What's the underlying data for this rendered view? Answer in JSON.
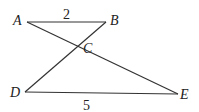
{
  "diagram": {
    "points": {
      "A": {
        "label": "A",
        "x": 27,
        "y": 22
      },
      "B": {
        "label": "B",
        "x": 106,
        "y": 22
      },
      "C": {
        "label": "C",
        "x": 78,
        "y": 47
      },
      "D": {
        "label": "D",
        "x": 25,
        "y": 92
      },
      "E": {
        "label": "E",
        "x": 178,
        "y": 94
      }
    },
    "segments": [
      {
        "from": "A",
        "to": "B"
      },
      {
        "from": "A",
        "to": "E"
      },
      {
        "from": "B",
        "to": "D"
      },
      {
        "from": "D",
        "to": "E"
      }
    ],
    "measurements": {
      "AB": "2",
      "DE": "5"
    },
    "line_color": "#333333"
  }
}
